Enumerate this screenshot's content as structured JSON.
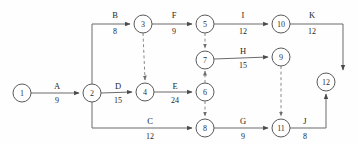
{
  "diagram": {
    "type": "activity-on-arrow-network",
    "canvas": {
      "width": 358,
      "height": 145,
      "background": "#fefefe"
    },
    "colors": {
      "node_stroke": "#5a5a5a",
      "node_fill": "#ffffff",
      "edge": "#6b6b6b",
      "dummy_edge": "#8a8a8a",
      "text": "#1f1f1f"
    },
    "nodes": [
      {
        "id": "1",
        "label": "1",
        "cx": 22,
        "cy": 93,
        "r": 9
      },
      {
        "id": "2",
        "label": "2",
        "cx": 92,
        "cy": 93,
        "r": 9
      },
      {
        "id": "3",
        "label": "3",
        "cx": 143,
        "cy": 24,
        "r": 9
      },
      {
        "id": "4",
        "label": "4",
        "cx": 145,
        "cy": 92,
        "r": 9
      },
      {
        "id": "5",
        "label": "5",
        "cx": 205,
        "cy": 24,
        "r": 9
      },
      {
        "id": "6",
        "label": "6",
        "cx": 205,
        "cy": 92,
        "r": 9
      },
      {
        "id": "7",
        "label": "7",
        "cx": 205,
        "cy": 60,
        "r": 9
      },
      {
        "id": "8",
        "label": "8",
        "cx": 205,
        "cy": 128,
        "r": 9
      },
      {
        "id": "9",
        "label": "9",
        "cx": 281,
        "cy": 57,
        "r": 9
      },
      {
        "id": "10",
        "label": "10",
        "cx": 281,
        "cy": 24,
        "r": 9
      },
      {
        "id": "11",
        "label": "11",
        "cx": 281,
        "cy": 128,
        "r": 9
      },
      {
        "id": "12",
        "label": "12",
        "cx": 326,
        "cy": 82,
        "r": 9
      }
    ],
    "activities": [
      {
        "id": "A",
        "name": "A",
        "duration": "9",
        "from": "1",
        "to": "2",
        "dummy": false,
        "name_x": 57,
        "name_y": 89,
        "dur_x": 57,
        "dur_y": 101
      },
      {
        "id": "B",
        "name": "B",
        "duration": "8",
        "from": "2",
        "to": "3",
        "dummy": false,
        "name_x": 115,
        "name_y": 16,
        "dur_x": 115,
        "dur_y": 32
      },
      {
        "id": "C",
        "name": "C",
        "duration": "12",
        "from": "2",
        "to": "8",
        "dummy": false,
        "name_x": 150,
        "name_y": 122,
        "dur_x": 150,
        "dur_y": 137
      },
      {
        "id": "D",
        "name": "D",
        "duration": "15",
        "from": "2",
        "to": "4",
        "dummy": false,
        "name_x": 118,
        "name_y": 88,
        "dur_x": 118,
        "dur_y": 101
      },
      {
        "id": "E",
        "name": "E",
        "duration": "24",
        "from": "4",
        "to": "6",
        "dummy": false,
        "name_x": 175,
        "name_y": 88,
        "dur_x": 175,
        "dur_y": 101
      },
      {
        "id": "F",
        "name": "F",
        "duration": "9",
        "from": "3",
        "to": "5",
        "dummy": false,
        "name_x": 174,
        "name_y": 16,
        "dur_x": 174,
        "dur_y": 32
      },
      {
        "id": "G",
        "name": "G",
        "duration": "9",
        "from": "8",
        "to": "11",
        "dummy": false,
        "name_x": 243,
        "name_y": 122,
        "dur_x": 243,
        "dur_y": 137
      },
      {
        "id": "H",
        "name": "H",
        "duration": "15",
        "from": "7",
        "to": "9",
        "dummy": false,
        "name_x": 243,
        "name_y": 52,
        "dur_x": 243,
        "dur_y": 66
      },
      {
        "id": "I",
        "name": "I",
        "duration": "12",
        "from": "5",
        "to": "10",
        "dummy": false,
        "name_x": 243,
        "name_y": 16,
        "dur_x": 243,
        "dur_y": 32
      },
      {
        "id": "J",
        "name": "J",
        "duration": "8",
        "from": "11",
        "to": "12",
        "dummy": false,
        "name_x": 305,
        "name_y": 122,
        "dur_x": 305,
        "dur_y": 137
      },
      {
        "id": "K",
        "name": "K",
        "duration": "12",
        "from": "10",
        "to": "12",
        "dummy": false,
        "name_x": 312,
        "name_y": 16,
        "dur_x": 312,
        "dur_y": 32
      },
      {
        "id": "d1",
        "name": "",
        "duration": "",
        "from": "3",
        "to": "4",
        "dummy": true
      },
      {
        "id": "d2",
        "name": "",
        "duration": "",
        "from": "5",
        "to": "7",
        "dummy": true
      },
      {
        "id": "d3",
        "name": "",
        "duration": "",
        "from": "6",
        "to": "7",
        "dummy": true
      },
      {
        "id": "d4",
        "name": "",
        "duration": "",
        "from": "6",
        "to": "8",
        "dummy": true
      },
      {
        "id": "d5",
        "name": "",
        "duration": "",
        "from": "9",
        "to": "11",
        "dummy": true
      }
    ]
  }
}
